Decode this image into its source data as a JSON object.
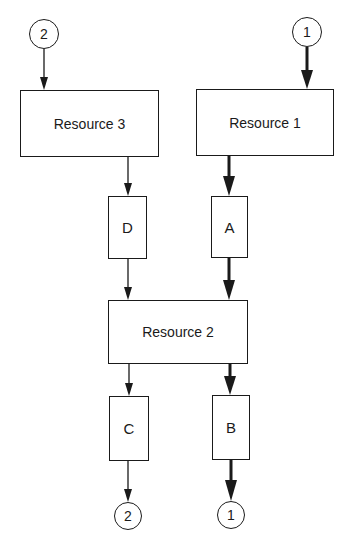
{
  "diagram": {
    "type": "resource-flow",
    "connectors_top": [
      {
        "id": "c2-top",
        "label": "2"
      },
      {
        "id": "c1-top",
        "label": "1"
      }
    ],
    "resources": [
      {
        "id": "r3",
        "label": "Resource 3"
      },
      {
        "id": "r1",
        "label": "Resource 1"
      },
      {
        "id": "r2",
        "label": "Resource 2"
      }
    ],
    "activities": [
      {
        "id": "D",
        "label": "D"
      },
      {
        "id": "A",
        "label": "A"
      },
      {
        "id": "C",
        "label": "C"
      },
      {
        "id": "B",
        "label": "B"
      }
    ],
    "connectors_bottom": [
      {
        "id": "c2-bottom",
        "label": "2"
      },
      {
        "id": "c1-bottom",
        "label": "1"
      }
    ],
    "edges": [
      {
        "from": "2",
        "to": "Resource 3",
        "weight": "thin"
      },
      {
        "from": "1",
        "to": "Resource 1",
        "weight": "thick"
      },
      {
        "from": "Resource 3",
        "to": "D",
        "weight": "thin"
      },
      {
        "from": "Resource 1",
        "to": "A",
        "weight": "thick"
      },
      {
        "from": "D",
        "to": "Resource 2",
        "weight": "thin"
      },
      {
        "from": "A",
        "to": "Resource 2",
        "weight": "thick"
      },
      {
        "from": "Resource 2",
        "to": "C",
        "weight": "thin"
      },
      {
        "from": "Resource 2",
        "to": "B",
        "weight": "thick"
      },
      {
        "from": "C",
        "to": "2",
        "weight": "thin"
      },
      {
        "from": "B",
        "to": "1",
        "weight": "thick"
      }
    ],
    "colors": {
      "line": "#1a1a1a",
      "background": "#ffffff"
    }
  }
}
